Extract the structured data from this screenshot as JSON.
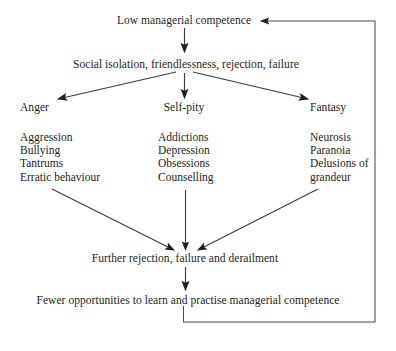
{
  "diagram": {
    "title": "Low managerial competence",
    "type": "flowchart-cycle",
    "nodes": {
      "root": "Low managerial competence",
      "consequence": "Social isolation, friendlessness, rejection, failure",
      "branch_left": "Anger",
      "branch_middle": "Self-pity",
      "branch_right": "Fantasy",
      "converge": "Further rejection, failure and derailment",
      "outcome": "Fewer opportunities to learn and practise managerial competence"
    },
    "columns": {
      "left": {
        "heading": "Anger",
        "items": [
          "Aggression",
          "Bullying",
          "Tantrums",
          "Erratic behaviour"
        ]
      },
      "middle": {
        "heading": "Self-pity",
        "items": [
          "Addictions",
          "Depression",
          "Obsessions",
          "Counselling"
        ]
      },
      "right": {
        "heading": "Fantasy",
        "items": [
          "Neurosis",
          "Paranoia",
          "Delusions of",
          "grandeur"
        ]
      }
    },
    "connectors": [
      {
        "name": "root-to-consequence",
        "kind": "arrow-down"
      },
      {
        "name": "consequence-to-anger",
        "kind": "arrow-diagonal-left"
      },
      {
        "name": "consequence-to-self-pity",
        "kind": "arrow-down"
      },
      {
        "name": "consequence-to-fantasy",
        "kind": "arrow-diagonal-right"
      },
      {
        "name": "anger-list-to-converge",
        "kind": "arrow-diagonal-right-down"
      },
      {
        "name": "self-pity-list-to-converge",
        "kind": "arrow-down"
      },
      {
        "name": "fantasy-list-to-converge",
        "kind": "arrow-diagonal-left-down"
      },
      {
        "name": "converge-to-outcome",
        "kind": "arrow-down"
      },
      {
        "name": "outcome-feedback-to-root",
        "kind": "feedback-loop-arrow-left"
      }
    ],
    "colors": {
      "ink": "#1d1d1d",
      "line": "#4a4a4a",
      "background": "#ffffff"
    }
  }
}
